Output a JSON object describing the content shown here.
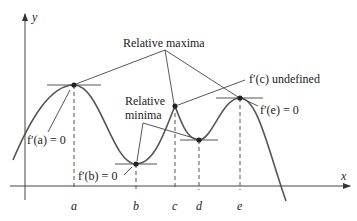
{
  "figure": {
    "axes": {
      "x_label": "x",
      "y_label": "y",
      "ticks": [
        "a",
        "b",
        "c",
        "d",
        "e"
      ]
    },
    "annotations": {
      "relative_maxima": "Relative maxima",
      "relative_minima_line1": "Relative",
      "relative_minima_line2": "minima",
      "fa": "f′(a) = 0",
      "fb": "f′(b) = 0",
      "fc": "f′(c) undefined",
      "fe": "f′(e) = 0"
    },
    "points": [
      {
        "name": "a",
        "type": "relative maximum",
        "derivative": "0"
      },
      {
        "name": "b",
        "type": "relative minimum",
        "derivative": "0"
      },
      {
        "name": "c",
        "type": "relative maximum",
        "derivative": "undefined"
      },
      {
        "name": "d",
        "type": "relative minimum",
        "derivative": "0"
      },
      {
        "name": "e",
        "type": "relative maximum",
        "derivative": "0"
      }
    ],
    "colors": {
      "curve": "#555555",
      "axes": "#444444",
      "text": "#222222"
    }
  }
}
